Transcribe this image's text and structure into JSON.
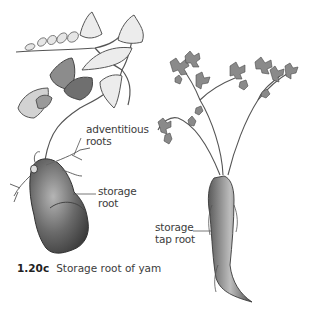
{
  "figure": {
    "caption_number": "1.20c",
    "caption_text": "Storage root of yam"
  },
  "labels": {
    "adventitious": {
      "line1": "adventitious",
      "line2": "roots"
    },
    "storage_root": {
      "line1": "storage",
      "line2": "root"
    },
    "tap_root": {
      "line1": "storage",
      "line2": "tap root"
    }
  },
  "illustrations": [
    {
      "name": "yam-plant",
      "description": "Yam vine with heart-shaped leaves and tuberous storage root"
    },
    {
      "name": "carrot-plant",
      "description": "Carrot with feathery leaves and storage tap root"
    }
  ],
  "colors": {
    "ink": "#3c3c3c",
    "leaf_light": "#d8d8d8",
    "leaf_dark": "#7a7a7a",
    "root": "#6e6e6e"
  }
}
